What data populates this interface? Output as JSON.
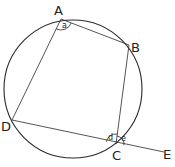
{
  "diagram": {
    "type": "cyclic-quadrilateral",
    "stroke_color": "#2a2a2a",
    "circle": {
      "cx": 73,
      "cy": 89,
      "r": 69
    },
    "points": {
      "A": {
        "label": "A",
        "x": 61,
        "y": 19,
        "lx": 54,
        "ly": 15
      },
      "B": {
        "label": "B",
        "x": 129,
        "y": 45,
        "lx": 131,
        "ly": 52
      },
      "C": {
        "label": "C",
        "x": 116,
        "y": 144,
        "lx": 112,
        "ly": 160
      },
      "D": {
        "label": "D",
        "x": 12,
        "y": 120,
        "lx": 1,
        "ly": 131
      },
      "E": {
        "label": "E",
        "x": 164,
        "y": 152,
        "lx": 163,
        "ly": 159
      }
    },
    "angles": {
      "a": {
        "label": "a",
        "vertex": "A",
        "lx": 62,
        "ly": 28
      },
      "d": {
        "label": "d",
        "vertex": "C",
        "position": "interior",
        "lx": 108,
        "ly": 140
      },
      "e": {
        "label": "e",
        "vertex": "C",
        "position": "exterior",
        "lx": 121,
        "ly": 141
      }
    },
    "segments": [
      "AB",
      "BC",
      "CD",
      "DA",
      "CE"
    ]
  }
}
